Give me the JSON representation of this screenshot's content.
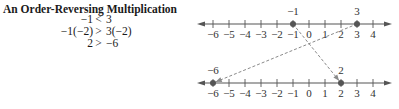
{
  "title": "An Order-Reversing Multiplication",
  "steps": [
    {
      "lhs": "−1",
      "rel": "<",
      "rhs": "3"
    },
    {
      "lhs": "−1(−2)",
      "rel": ">",
      "rhs": "3(−2)"
    },
    {
      "lhs": "2",
      "rel": ">",
      "rhs": "−6"
    }
  ],
  "number_lines": [
    {
      "name": "original",
      "ticks": [
        "−6",
        "−5",
        "−4",
        "−3",
        "−2",
        "−1",
        "0",
        "1",
        "2",
        "3",
        "4"
      ],
      "tick_values": [
        -6,
        -5,
        -4,
        -3,
        -2,
        -1,
        0,
        1,
        2,
        3,
        4
      ],
      "points": [
        {
          "value": -1,
          "label": "−1"
        },
        {
          "value": 3,
          "label": "3"
        }
      ]
    },
    {
      "name": "multiplied-by-negative-2",
      "ticks": [
        "−6",
        "−5",
        "−4",
        "−3",
        "−2",
        "−1",
        "0",
        "1",
        "2",
        "3",
        "4"
      ],
      "tick_values": [
        -6,
        -5,
        -4,
        -3,
        -2,
        -1,
        0,
        1,
        2,
        3,
        4
      ],
      "points": [
        {
          "value": -6,
          "label": "−6"
        },
        {
          "value": 2,
          "label": "2"
        }
      ]
    }
  ],
  "mappings": [
    {
      "from": -1,
      "to": 2
    },
    {
      "from": 3,
      "to": -6
    }
  ],
  "colors": {
    "line": "#555555",
    "point": "#555555",
    "dashed": "#8a8a8a"
  }
}
